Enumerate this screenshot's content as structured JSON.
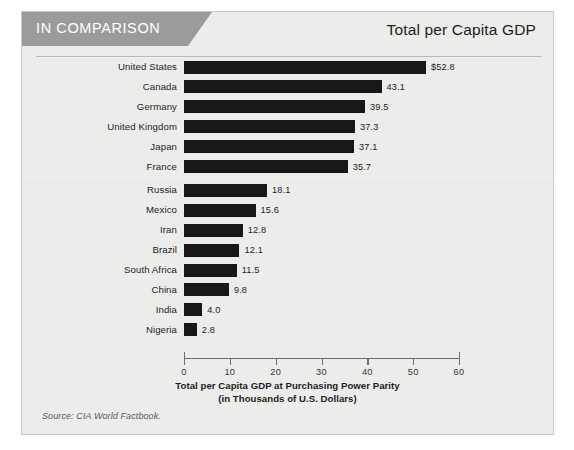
{
  "header": {
    "banner_label": "IN COMPARISON",
    "title": "Total per Capita GDP"
  },
  "source_note": "Source: CIA World Factbook.",
  "colors": {
    "banner": "#9b9b99",
    "card_background": "#ececeb",
    "card_border": "#c9c9c7",
    "bar": "#17171a",
    "axis": "#6e6e6c",
    "text": "#1d1d1b"
  },
  "chart_data": {
    "type": "bar",
    "orientation": "horizontal",
    "title": "Total per Capita GDP",
    "xlabel": "Total per Capita GDP at Purchasing Power Parity (in Thousands of U.S. Dollars)",
    "xlabel_line1": "Total per Capita GDP at Purchasing Power Parity",
    "xlabel_line2": "(in Thousands of U.S. Dollars)",
    "ylabel": "",
    "xlim": [
      0,
      60
    ],
    "xticks": [
      0,
      10,
      20,
      30,
      40,
      50,
      60
    ],
    "xtick_labels": [
      "0",
      "10",
      "20",
      "30",
      "40",
      "50",
      "60"
    ],
    "grid": false,
    "legend": false,
    "categories": [
      "United States",
      "Canada",
      "Germany",
      "United Kingdom",
      "Japan",
      "France",
      "Russia",
      "Mexico",
      "Iran",
      "Brazil",
      "South Africa",
      "China",
      "India",
      "Nigeria"
    ],
    "values": [
      52.8,
      43.1,
      39.5,
      37.3,
      37.1,
      35.7,
      18.1,
      15.6,
      12.8,
      12.1,
      11.5,
      9.8,
      4.0,
      2.8
    ],
    "data_labels": [
      "$52.8",
      "43.1",
      "39.5",
      "37.3",
      "37.1",
      "35.7",
      "18.1",
      "15.6",
      "12.8",
      "12.1",
      "11.5",
      "9.8",
      "4.0",
      "2.8"
    ],
    "group_break_after_index": 5
  }
}
